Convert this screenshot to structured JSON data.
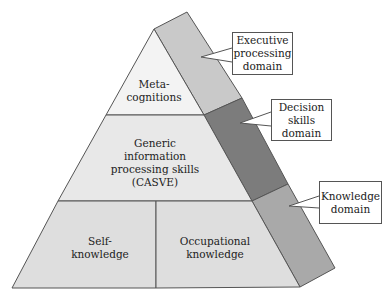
{
  "diagram": {
    "type": "pyramid",
    "front_panels": {
      "top": "Meta-\ncognitions",
      "middle": "Generic\ninformation\nprocessing skills\n(CASVE)",
      "bottom_left": "Self-\nknowledge",
      "bottom_right": "Occupational\nknowledge"
    },
    "callouts": {
      "executive": "Executive\nprocessing\ndomain",
      "decision": "Decision\nskills\ndomain",
      "knowledge": "Knowledge\ndomain"
    },
    "colors": {
      "front_top": "#f3f3f3",
      "front_middle": "#e8e8e8",
      "front_bottom": "#dedede",
      "side_top": "#c9c9c9",
      "side_middle": "#7c7c7c",
      "side_bottom": "#a9a9a9",
      "stroke": "#555555"
    }
  }
}
